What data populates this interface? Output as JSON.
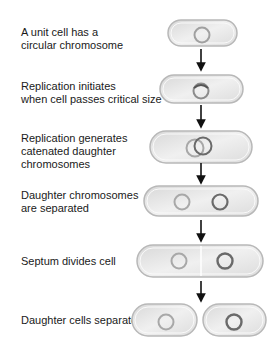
{
  "steps": [
    {
      "label": "A unit cell has a\ncircular chromosome"
    },
    {
      "label": "Replication initiates\nwhen cell passes critical size"
    },
    {
      "label": "Replication generates\ncatenated daughter\nchromosomes"
    },
    {
      "label": "Daughter chromosomes\nare separated"
    },
    {
      "label": "Septum divides cell"
    },
    {
      "label": "Daughter cells separate"
    }
  ],
  "colors": {
    "cell_fill": "#e4e4e4",
    "cell_stroke": "#b8b8b8",
    "chromosome_light": "#a8a8a8",
    "chromosome_dark": "#6a6a6a",
    "arrow": "#111111"
  }
}
